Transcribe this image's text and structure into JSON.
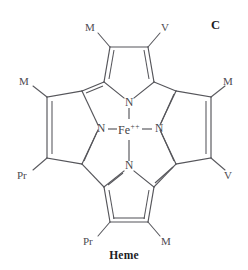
{
  "figure": {
    "panel_letter": "C",
    "caption": "Heme",
    "background_color": "#ffffff",
    "line_color": "#55555a",
    "text_color": "#46464b"
  },
  "molecule": {
    "name": "Heme",
    "center_metal": {
      "symbol": "Fe",
      "charge": "++",
      "full_label": "Fe++",
      "oxidation_state": 2
    },
    "nitrogens": [
      {
        "id": "n-top",
        "label": "N",
        "position": "top"
      },
      {
        "id": "n-left",
        "label": "N",
        "position": "left"
      },
      {
        "id": "n-right",
        "label": "N",
        "position": "right"
      },
      {
        "id": "n-bottom",
        "label": "N",
        "position": "bottom"
      }
    ],
    "substituents": [
      {
        "id": "sub-top-left",
        "label": "M",
        "ring": "top",
        "side": "left"
      },
      {
        "id": "sub-top-right",
        "label": "V",
        "ring": "top",
        "side": "right"
      },
      {
        "id": "sub-left-upper",
        "label": "M",
        "ring": "left",
        "side": "upper"
      },
      {
        "id": "sub-left-lower",
        "label": "Pr",
        "ring": "left",
        "side": "lower"
      },
      {
        "id": "sub-right-upper",
        "label": "M",
        "ring": "right",
        "side": "upper"
      },
      {
        "id": "sub-right-lower",
        "label": "V",
        "ring": "right",
        "side": "lower"
      },
      {
        "id": "sub-bottom-left",
        "label": "Pr",
        "ring": "bottom",
        "side": "left"
      },
      {
        "id": "sub-bottom-right",
        "label": "M",
        "ring": "bottom",
        "side": "right"
      }
    ]
  }
}
